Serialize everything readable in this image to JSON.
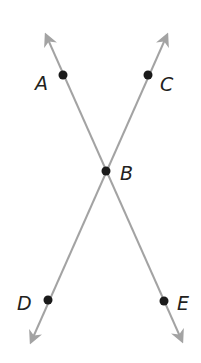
{
  "diagram": {
    "type": "intersecting-lines",
    "line_color": "#a3a3a3",
    "point_color": "#1a1a1a",
    "label_color": "#231f20",
    "lines": [
      {
        "name": "line-AE",
        "through": [
          "A",
          "B",
          "E"
        ],
        "start": {
          "x": 46,
          "y": 35
        },
        "end": {
          "x": 182,
          "y": 341
        }
      },
      {
        "name": "line-CD",
        "through": [
          "C",
          "B",
          "D"
        ],
        "start": {
          "x": 167,
          "y": 35
        },
        "end": {
          "x": 31,
          "y": 342
        }
      }
    ],
    "points": [
      {
        "label": "A",
        "x": 63,
        "y": 75,
        "label_x": 35,
        "label_y": 90
      },
      {
        "label": "C",
        "x": 148,
        "y": 75,
        "label_x": 160,
        "label_y": 91
      },
      {
        "label": "B",
        "x": 106,
        "y": 171,
        "label_x": 120,
        "label_y": 180
      },
      {
        "label": "D",
        "x": 48,
        "y": 300,
        "label_x": 17,
        "label_y": 310
      },
      {
        "label": "E",
        "x": 164,
        "y": 301,
        "label_x": 177,
        "label_y": 310
      }
    ]
  }
}
